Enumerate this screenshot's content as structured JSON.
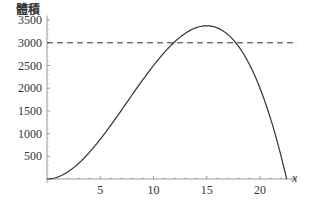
{
  "chart_data": {
    "type": "line",
    "title": "",
    "xlabel": "x",
    "ylabel": "體積",
    "xlim": [
      0,
      23.5
    ],
    "ylim": [
      0,
      3600
    ],
    "x_ticks": [
      5,
      10,
      15,
      20
    ],
    "y_ticks": [
      500,
      1000,
      1500,
      2000,
      2500,
      3000,
      3500
    ],
    "grid": false,
    "legend": null,
    "series": [
      {
        "name": "V(x) = x^2 (45 - 2x)",
        "style": "solid",
        "color": "#333333",
        "x": [
          0,
          1,
          2,
          3,
          4,
          5,
          6,
          7,
          8,
          9,
          10,
          11,
          12,
          13,
          14,
          15,
          16,
          17,
          18,
          19,
          20,
          21,
          22,
          22.5
        ],
        "y": [
          0,
          43,
          164,
          351,
          592,
          875,
          1188,
          1519,
          1856,
          2187,
          2500,
          2783,
          3024,
          3211,
          3332,
          3375,
          3328,
          3179,
          2916,
          2527,
          2000,
          1323,
          484,
          0
        ]
      },
      {
        "name": "reference line",
        "style": "dashed",
        "color": "#333333",
        "x": [
          0,
          23.5
        ],
        "y": [
          3000,
          3000
        ]
      }
    ]
  }
}
